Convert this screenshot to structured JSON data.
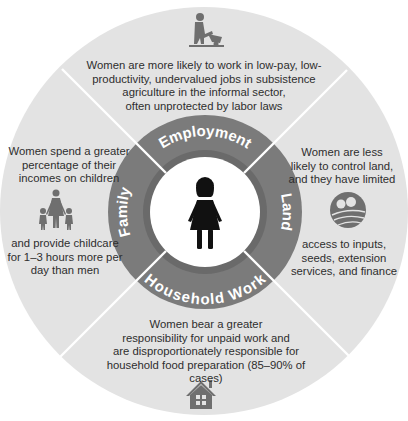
{
  "diagram": {
    "colors": {
      "outer_fill": "#e3e3e3",
      "ring_fill": "#7b7b7b",
      "ring_inner_band": "#6a6a6a",
      "center_fill": "#ffffff",
      "icon_fill": "#6f6f6f",
      "divider": "#ffffff",
      "ring_label": "#ffffff"
    },
    "center": {
      "icon": "woman-icon"
    },
    "ring_labels": {
      "top": "Employment",
      "right": "Land",
      "bottom": "Household Work",
      "left": "Family"
    },
    "segments": {
      "employment": {
        "icon": "farmer-wheelbarrow-icon",
        "lines": [
          "Women are more likely to work in low-pay, low-",
          "productivity, undervalued jobs in subsistence",
          "agriculture in the informal sector,",
          "often unprotected by labor laws"
        ]
      },
      "land": {
        "icon": "farmland-icon",
        "lines_before": [
          "Women are less",
          "likely to control land,",
          "and they have limited"
        ],
        "lines_after": [
          "access to inputs,",
          "seeds, extension",
          "services, and finance"
        ]
      },
      "household_work": {
        "icon": "house-icon",
        "lines": [
          "Women bear a greater",
          "responsibility for unpaid work and",
          "are disproportionately responsible for",
          "household food preparation (85–90% of cases)"
        ]
      },
      "family": {
        "icon": "mother-children-icon",
        "lines_before": [
          "Women spend a greater",
          "percentage of their",
          "incomes on children"
        ],
        "lines_after": [
          "and provide childcare",
          "for 1–3 hours more per",
          "day than men"
        ]
      }
    }
  }
}
